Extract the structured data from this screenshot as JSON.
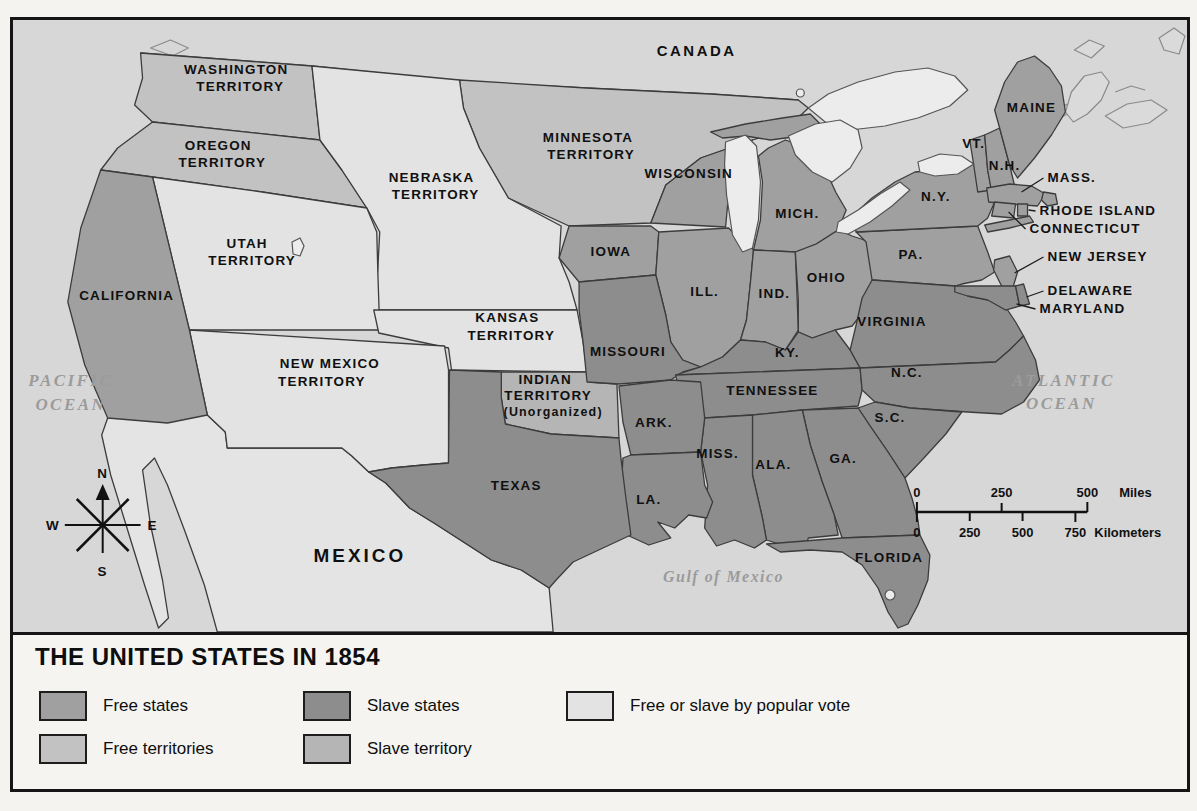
{
  "figure": {
    "title": "THE UNITED STATES IN 1854",
    "legend": {
      "items": [
        {
          "label": "Free states",
          "key": "free_state"
        },
        {
          "label": "Free territories",
          "key": "free_territory"
        },
        {
          "label": "Slave states",
          "key": "slave_state"
        },
        {
          "label": "Slave territory",
          "key": "slave_territory"
        },
        {
          "label": "Free or slave by popular vote",
          "key": "popular_vote"
        }
      ]
    }
  },
  "colors": {
    "free_state": "#a0a0a0",
    "free_territory": "#c2c2c2",
    "slave_state": "#8d8d8d",
    "slave_territory": "#b5b5b5",
    "popular_vote": "#e3e3e3",
    "foreign_land": "#e4e4e4",
    "water": "#d7d7d7",
    "lake": "#ececec"
  },
  "map": {
    "labels": {
      "canada": "CANADA",
      "mexico": "MEXICO",
      "pacific_1": "PACIFIC",
      "pacific_2": "OCEAN",
      "atlantic_1": "ATLANTIC",
      "atlantic_2": "OCEAN",
      "gulf": "Gulf of Mexico",
      "washington_1": "WASHINGTON",
      "washington_2": "TERRITORY",
      "oregon_1": "OREGON",
      "oregon_2": "TERRITORY",
      "minnesota_1": "MINNESOTA",
      "minnesota_2": "TERRITORY",
      "nebraska_1": "NEBRASKA",
      "nebraska_2": "TERRITORY",
      "utah_1": "UTAH",
      "utah_2": "TERRITORY",
      "kansas_1": "KANSAS",
      "kansas_2": "TERRITORY",
      "new_mexico_1": "NEW MEXICO",
      "new_mexico_2": "TERRITORY",
      "indian_1": "INDIAN",
      "indian_2": "TERRITORY",
      "indian_3": "(Unorganized)",
      "california": "CALIFORNIA",
      "texas": "TEXAS",
      "wisconsin": "WISCONSIN",
      "michigan": "MICH.",
      "iowa": "IOWA",
      "illinois": "ILL.",
      "indiana": "IND.",
      "ohio": "OHIO",
      "missouri": "MISSOURI",
      "kentucky": "KY.",
      "virginia": "VIRGINIA",
      "tennessee": "TENNESSEE",
      "north_carolina": "N.C.",
      "south_carolina": "S.C.",
      "georgia": "GA.",
      "alabama": "ALA.",
      "mississippi": "MISS.",
      "arkansas": "ARK.",
      "louisiana": "LA.",
      "florida": "FLORIDA",
      "maine": "MAINE",
      "vermont": "VT.",
      "new_hampshire": "N.H.",
      "new_york": "N.Y.",
      "pennsylvania": "PA.",
      "massachusetts": "MASS.",
      "rhode_island": "RHODE ISLAND",
      "connecticut": "CONNECTICUT",
      "new_jersey": "NEW JERSEY",
      "delaware": "DELAWARE",
      "maryland": "MARYLAND"
    },
    "compass": {
      "n": "N",
      "e": "E",
      "s": "S",
      "w": "W"
    },
    "scale": {
      "miles": {
        "ticks": [
          "0",
          "250",
          "500"
        ],
        "unit": "Miles"
      },
      "km": {
        "ticks": [
          "0",
          "250",
          "500",
          "750"
        ],
        "unit": "Kilometers"
      }
    },
    "categories": {
      "free_states": [
        "California",
        "Wisconsin",
        "Michigan",
        "Iowa",
        "Illinois",
        "Indiana",
        "Ohio",
        "Pennsylvania",
        "New York",
        "New Jersey",
        "Maine",
        "Vermont",
        "New Hampshire",
        "Massachusetts",
        "Rhode Island",
        "Connecticut"
      ],
      "slave_states": [
        "Missouri",
        "Kentucky",
        "Virginia",
        "Tennessee",
        "North Carolina",
        "South Carolina",
        "Georgia",
        "Alabama",
        "Mississippi",
        "Arkansas",
        "Louisiana",
        "Texas",
        "Florida",
        "Maryland",
        "Delaware"
      ],
      "free_territories": [
        "Washington Territory",
        "Oregon Territory",
        "Minnesota Territory"
      ],
      "slave_territories": [
        "Indian Territory (Unorganized)"
      ],
      "popular_vote": [
        "Nebraska Territory",
        "Kansas Territory",
        "Utah Territory",
        "New Mexico Territory"
      ]
    }
  }
}
